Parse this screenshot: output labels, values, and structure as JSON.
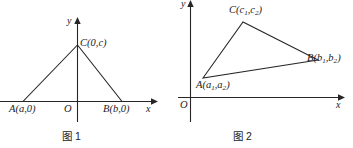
{
  "figures": [
    {
      "id": "figure-1",
      "caption": "图 1",
      "axes": {
        "x_label": "x",
        "y_label": "y",
        "origin_label": "O"
      },
      "points": [
        {
          "name": "A",
          "label": "A(a,0)"
        },
        {
          "name": "B",
          "label": "B(b,0)"
        },
        {
          "name": "C",
          "label": "C(0,c)"
        }
      ]
    },
    {
      "id": "figure-2",
      "caption": "图 2",
      "axes": {
        "x_label": "x",
        "y_label": "y",
        "origin_label": "O"
      },
      "points": [
        {
          "name": "A",
          "label_main": "A(a",
          "label_sub1": "1",
          "label_mid": ",a",
          "label_sub2": "2",
          "label_end": ")"
        },
        {
          "name": "B",
          "label_main": "B(b",
          "label_sub1": "1",
          "label_mid": ",b",
          "label_sub2": "2",
          "label_end": ")"
        },
        {
          "name": "C",
          "label_main": "C(c",
          "label_sub1": "1",
          "label_mid": ",c",
          "label_sub2": "2",
          "label_end": ")"
        }
      ]
    }
  ],
  "fig1": {
    "y_label": "y",
    "x_label": "x",
    "origin": "O",
    "label_A": "A(a,0)",
    "label_B": "B(b,0)",
    "label_C": "C(0,c)",
    "caption": "图 1"
  },
  "fig2": {
    "y_label": "y",
    "x_label": "x",
    "origin": "O",
    "A_pre": "A(a",
    "A_s1": "1",
    "A_mid": ",a",
    "A_s2": "2",
    "A_end": ")",
    "B_pre": "B(b",
    "B_s1": "1",
    "B_mid": ",b",
    "B_s2": "2",
    "B_end": ")",
    "C_pre": "C(c",
    "C_s1": "1",
    "C_mid": ",c",
    "C_s2": "2",
    "C_end": ")",
    "caption": "图 2"
  },
  "colors": {
    "ink": "#262626",
    "background": "#ffffff"
  }
}
